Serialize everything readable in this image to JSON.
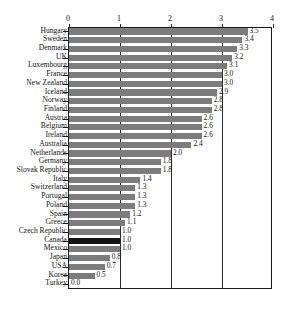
{
  "chart_data": {
    "type": "bar",
    "orientation": "horizontal",
    "title": "",
    "xlabel": "",
    "ylabel": "",
    "xlim": [
      0,
      4
    ],
    "xticks": [
      "0",
      "1",
      "2",
      "3",
      "4"
    ],
    "grid": true,
    "legend": null,
    "highlight_category": "Canada",
    "colors": {
      "bar": "#7c7c7c",
      "highlight_bar": "#131313",
      "axis": "#1a1a1a",
      "text": "#141414",
      "background": "#ffffff"
    },
    "categories": [
      "Hungary",
      "Sweden",
      "Denmark",
      "UK",
      "Luxembourg",
      "France",
      "New Zealand",
      "Iceland",
      "Norway",
      "Finland",
      "Austria",
      "Belgium",
      "Ireland",
      "Australia",
      "Netherlands",
      "Germany",
      "Slovak Republic",
      "Italy",
      "Switzerland",
      "Portugal",
      "Poland",
      "Spain",
      "Greece",
      "Czech Republic",
      "Canada",
      "Mexico",
      "Japan",
      "USA",
      "Korea",
      "Turkey"
    ],
    "values": [
      3.5,
      3.4,
      3.3,
      3.2,
      3.1,
      3.0,
      3.0,
      2.9,
      2.8,
      2.8,
      2.6,
      2.6,
      2.6,
      2.4,
      2.0,
      1.8,
      1.8,
      1.4,
      1.3,
      1.3,
      1.3,
      1.2,
      1.1,
      1.0,
      1.0,
      1.0,
      0.8,
      0.7,
      0.5,
      0.0
    ],
    "value_labels": [
      "3.5",
      "3.4",
      "3.3",
      "3.2",
      "3.1",
      "3.0",
      "3.0",
      "2.9",
      "2.8",
      "2.8",
      "2.6",
      "2.6",
      "2.6",
      "2.4",
      "2.0",
      "1.8",
      "1.8",
      "1.4",
      "1.3",
      "1.3",
      "1.3",
      "1.2",
      "1.1",
      "1.0",
      "1.0",
      "1.0",
      "0.8",
      "0.7",
      "0.5",
      "0.0"
    ]
  }
}
